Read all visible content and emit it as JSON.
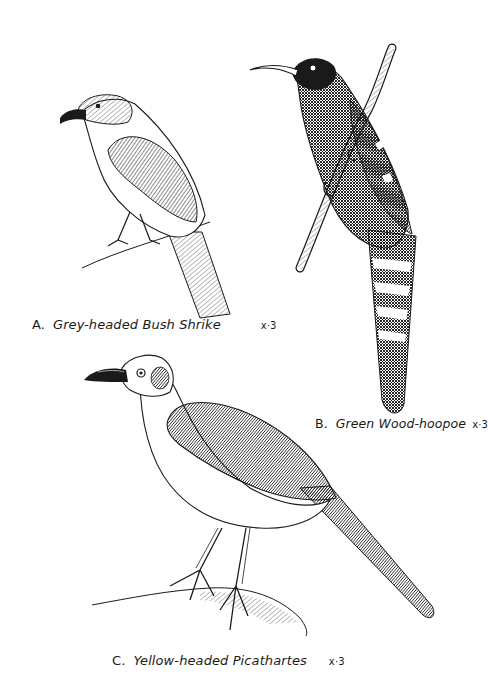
{
  "plate": {
    "figures": [
      {
        "id": "A",
        "letter": "A.",
        "name": "Grey-headed Bush Shrike",
        "scale": "x·3"
      },
      {
        "id": "B",
        "letter": "B.",
        "name": "Green Wood-hoopoe",
        "scale": "x·3"
      },
      {
        "id": "C",
        "letter": "C.",
        "name": "Yellow-headed Picathartes",
        "scale": "x·3"
      }
    ],
    "colors": {
      "paper": "#ffffff",
      "ink": "#1a1a1a"
    }
  }
}
